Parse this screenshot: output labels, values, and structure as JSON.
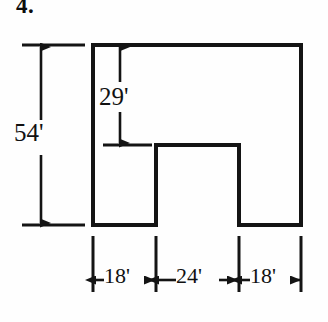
{
  "problem": {
    "number": "4."
  },
  "figure": {
    "kind": "notched-rectangle-dimension-diagram",
    "unit_symbol": "'",
    "stroke_color": "#141414",
    "background_color": "#fefefe",
    "outline": {
      "description": "rectangle with a rectangular notch cut out of the bottom middle"
    }
  },
  "dimensions": {
    "overall_height": "54'",
    "upper_height": "29'",
    "left_width": "18'",
    "notch_width": "24'",
    "right_width": "18'"
  },
  "labels": {
    "height_total": "54'",
    "height_upper": "29'",
    "width_left": "18'",
    "width_middle": "24'",
    "width_right": "18'"
  },
  "geometry": {
    "outer": {
      "left": 93,
      "top": 45,
      "right": 301,
      "bottom": 225
    },
    "notch": {
      "left": 156,
      "top": 145,
      "right": 239,
      "bottom": 225
    },
    "dim_54_x": 41,
    "dim_29_x": 120,
    "baseline_y": 280,
    "tick_xs": [
      93,
      156,
      239,
      301
    ]
  }
}
